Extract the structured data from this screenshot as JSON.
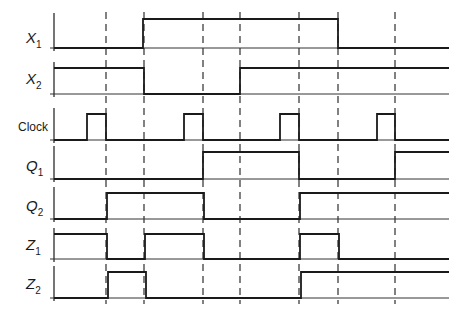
{
  "diagram": {
    "x_start": 54,
    "x_end": 449,
    "colors": {
      "line": "#1a1a1a",
      "background": "#ffffff"
    },
    "dashed_lines_x": [
      106,
      144,
      203,
      240,
      299,
      338,
      395
    ],
    "signals": [
      {
        "name": "X1",
        "label": "X",
        "subscript": "1",
        "italic": true,
        "baseline_y": 48,
        "high_y": 19,
        "label_y": 38,
        "transitions": [
          [
            54,
            0
          ],
          [
            143,
            1
          ],
          [
            338,
            0
          ]
        ]
      },
      {
        "name": "X2",
        "label": "X",
        "subscript": "2",
        "italic": true,
        "baseline_y": 94,
        "high_y": 68,
        "label_y": 79,
        "transitions": [
          [
            54,
            1
          ],
          [
            144,
            0
          ],
          [
            240,
            1
          ]
        ]
      },
      {
        "name": "Clock",
        "label": "Clock",
        "subscript": "",
        "italic": false,
        "baseline_y": 140,
        "high_y": 114,
        "label_y": 126,
        "transitions": [
          [
            54,
            0
          ],
          [
            87,
            1
          ],
          [
            106,
            0
          ],
          [
            184,
            1
          ],
          [
            203,
            0
          ],
          [
            280,
            1
          ],
          [
            299,
            0
          ],
          [
            377,
            1
          ],
          [
            395,
            0
          ]
        ]
      },
      {
        "name": "Q1",
        "label": "Q",
        "subscript": "1",
        "italic": true,
        "baseline_y": 179,
        "high_y": 152,
        "label_y": 166,
        "transitions": [
          [
            54,
            0
          ],
          [
            203,
            1
          ],
          [
            299,
            0
          ],
          [
            395,
            1
          ]
        ]
      },
      {
        "name": "Q2",
        "label": "Q",
        "subscript": "2",
        "italic": true,
        "baseline_y": 219,
        "high_y": 193,
        "label_y": 206,
        "transitions": [
          [
            54,
            0
          ],
          [
            107,
            1
          ],
          [
            204,
            0
          ],
          [
            300,
            1
          ]
        ]
      },
      {
        "name": "Z1",
        "label": "Z",
        "subscript": "1",
        "italic": true,
        "baseline_y": 259,
        "high_y": 234,
        "label_y": 245,
        "transitions": [
          [
            54,
            1
          ],
          [
            107,
            0
          ],
          [
            145,
            1
          ],
          [
            204,
            0
          ],
          [
            300,
            1
          ],
          [
            339,
            0
          ]
        ]
      },
      {
        "name": "Z2",
        "label": "Z",
        "subscript": "2",
        "italic": true,
        "baseline_y": 298,
        "high_y": 272,
        "label_y": 284,
        "transitions": [
          [
            54,
            0
          ],
          [
            108,
            1
          ],
          [
            146,
            0
          ],
          [
            301,
            1
          ]
        ]
      }
    ]
  }
}
